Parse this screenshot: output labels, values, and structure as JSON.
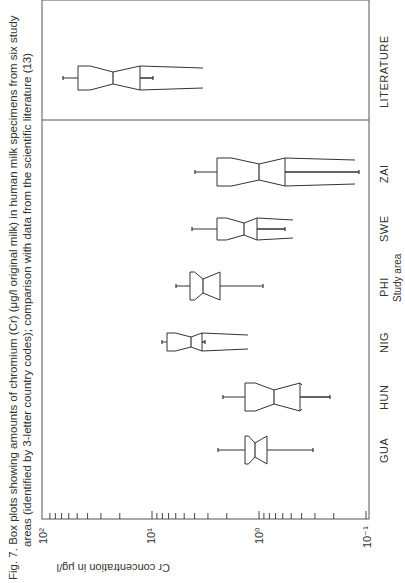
{
  "caption": {
    "line1": "Fig. 7.   Box plots showing amounts of chromium (Cr) (μg/l original milk) in human milk specimens from six study",
    "line2": "areas (identified by 3-letter country codes); comparison with data from the scientific literature (13)"
  },
  "axes": {
    "value_axis_label": "Cr concentration in μg/l",
    "category_axis_label": "Study area",
    "ticks": [
      {
        "label": "10²",
        "value": 100
      },
      {
        "label": "10¹",
        "value": 10
      },
      {
        "label": "10⁰",
        "value": 1
      },
      {
        "label": "10⁻¹",
        "value": 0.1
      }
    ]
  },
  "chart_data": {
    "type": "box",
    "xlabel": "Study area",
    "ylabel": "Cr concentration in μg/l",
    "yscale": "log",
    "ylim": [
      0.1,
      100
    ],
    "orientation": "figure rotated 90°; value axis runs horizontally (10² left → 10⁻¹ right)",
    "categories": [
      "GUA",
      "HUN",
      "NIG",
      "PHI",
      "SWE",
      "ZAI",
      "LITERATURE"
    ],
    "series": [
      {
        "name": "GUA",
        "whisker_high": 2.4,
        "q3": 1.35,
        "median": 1.1,
        "q1": 0.84,
        "whisker_low": 0.31
      },
      {
        "name": "HUN",
        "whisker_high": 2.2,
        "q3": 1.35,
        "median": 0.72,
        "q1": 0.41,
        "whisker_low": 0.22
      },
      {
        "name": "NIG",
        "whisker_high": 8.2,
        "q3": 7.2,
        "median": 4.3,
        "q1": 1.2,
        "whisker_low": 4.5
      },
      {
        "name": "PHI",
        "whisker_high": 6.0,
        "q3": 4.4,
        "median": 3.3,
        "q1": 2.3,
        "whisker_low": 0.92
      },
      {
        "name": "SWE",
        "whisker_high": 4.1,
        "q3": 2.3,
        "median": 1.3,
        "q1": 0.95,
        "whisker_low": 0.52
      },
      {
        "name": "ZAI",
        "whisker_high": 3.8,
        "q3": 2.3,
        "median": 1.0,
        "q1": 0.53,
        "whisker_low": 0.13
      },
      {
        "name": "LITERATURE",
        "whisker_high": 39,
        "q3": 28,
        "median": 14,
        "q1": 7.0,
        "whisker_low": 5.8
      }
    ],
    "grid": false,
    "legend": "none",
    "divider": "vertical line separating study areas from LITERATURE"
  },
  "plot_px": {
    "frame": {
      "x0": 42,
      "x1": 369,
      "y0": 0,
      "y1": 519
    },
    "axis_x_for_1": 259,
    "px_per_decade": 107,
    "divider_y": 120,
    "boxes": [
      {
        "name": "GUA",
        "y": 450,
        "half": 14,
        "notch_half": 7,
        "wl": 218,
        "b1": 245,
        "med": 255,
        "b2": 267,
        "wh": 313,
        "tail": 267
      },
      {
        "name": "HUN",
        "y": 397,
        "half": 14,
        "notch_half": 7,
        "wl": 223,
        "b1": 245,
        "med": 274,
        "b2": 300,
        "wh": 330,
        "tail": 302
      },
      {
        "name": "NIG",
        "y": 342,
        "half": 9,
        "notch_half": 5,
        "wl": 162,
        "b1": 167,
        "med": 191,
        "b2": 202,
        "wh": 205,
        "tail": 248
      },
      {
        "name": "PHI",
        "y": 286,
        "half": 14,
        "notch_half": 7,
        "wl": 176,
        "b1": 190,
        "med": 203,
        "b2": 220,
        "wh": 263,
        "tail": 190
      },
      {
        "name": "SWE",
        "y": 229,
        "half": 11,
        "notch_half": 6,
        "wl": 192,
        "b1": 217,
        "med": 244,
        "b2": 257,
        "wh": 285,
        "tail": 293
      },
      {
        "name": "ZAI",
        "y": 172,
        "half": 14,
        "notch_half": 8,
        "wl": 195,
        "b1": 217,
        "med": 259,
        "b2": 285,
        "wh": 359,
        "tail": 355
      },
      {
        "name": "LITERATURE",
        "y": 78,
        "half": 12,
        "notch_half": 6,
        "wl": 63,
        "b1": 78,
        "med": 113,
        "b2": 140,
        "wh": 153,
        "tail": 203
      }
    ]
  }
}
